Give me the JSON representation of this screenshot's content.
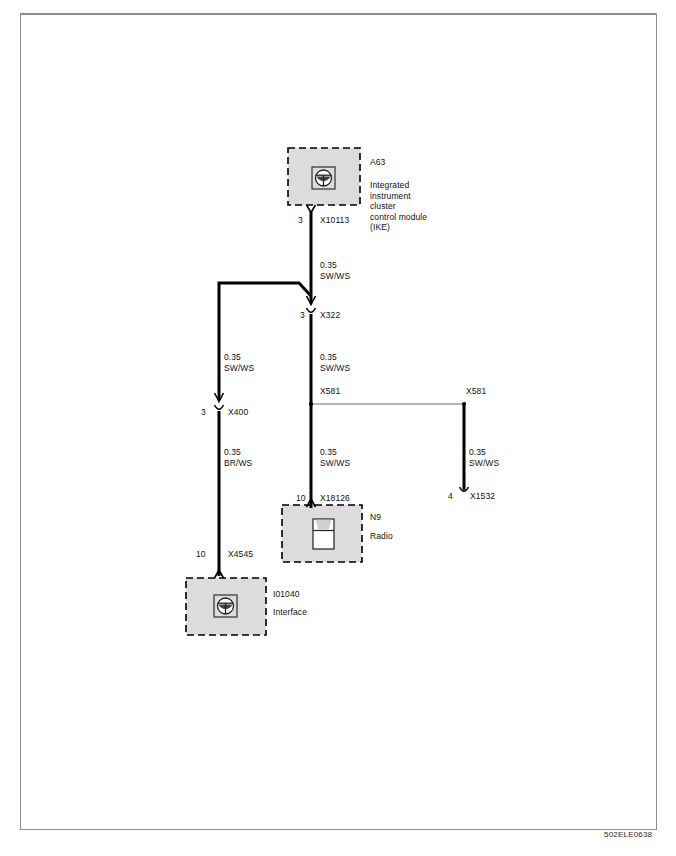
{
  "document": {
    "id_label": "502ELE0638",
    "type": "automotive-wiring-diagram"
  },
  "modules": [
    {
      "key": "ike",
      "ref": "A63",
      "name": "Integrated\ninstrument\ncluster\ncontrol module\n(IKE)",
      "name_lines": [
        "Integrated",
        "instrument",
        "cluster",
        "control module",
        "(IKE)"
      ],
      "icon": "steering-wheel-icon"
    },
    {
      "key": "radio",
      "ref": "N9",
      "name": "Radio",
      "name_lines": [
        "Radio"
      ],
      "icon": "radio-unit-icon"
    },
    {
      "key": "interface",
      "ref": "I01040",
      "name": "Interface",
      "name_lines": [
        "Interface"
      ],
      "icon": "steering-wheel-icon"
    }
  ],
  "connectors": [
    {
      "key": "x10113",
      "pin": "3",
      "name": "X10113"
    },
    {
      "key": "x322",
      "pin": "3",
      "name": "X322"
    },
    {
      "key": "x400",
      "pin": "3",
      "name": "X400"
    },
    {
      "key": "x4545",
      "pin": "10",
      "name": "X4545"
    },
    {
      "key": "x18126",
      "pin": "10",
      "name": "X18126"
    },
    {
      "key": "x1532",
      "pin": "4",
      "name": "X1532"
    }
  ],
  "splices": [
    {
      "key": "x581_left",
      "name": "X581"
    },
    {
      "key": "x581_right",
      "name": "X581"
    }
  ],
  "wires": [
    {
      "key": "w_ike_x322",
      "gauge": "0.35",
      "color_code": "SW/WS"
    },
    {
      "key": "w_x322_x581",
      "gauge": "0.35",
      "color_code": "SW/WS"
    },
    {
      "key": "w_branch_x400",
      "gauge": "0.35",
      "color_code": "SW/WS"
    },
    {
      "key": "w_x400_x4545",
      "gauge": "0.35",
      "color_code": "BR/WS"
    },
    {
      "key": "w_x581_x18126",
      "gauge": "0.35",
      "color_code": "SW/WS"
    },
    {
      "key": "w_x581_x1532",
      "gauge": "0.35",
      "color_code": "SW/WS"
    }
  ],
  "colors": {
    "wire": "#000000",
    "module_fill": "#dcdcdc",
    "module_border": "#000000",
    "sheet_border": "#8d8d8d",
    "text": "#101010",
    "splice_link": "#6e6e6e"
  }
}
